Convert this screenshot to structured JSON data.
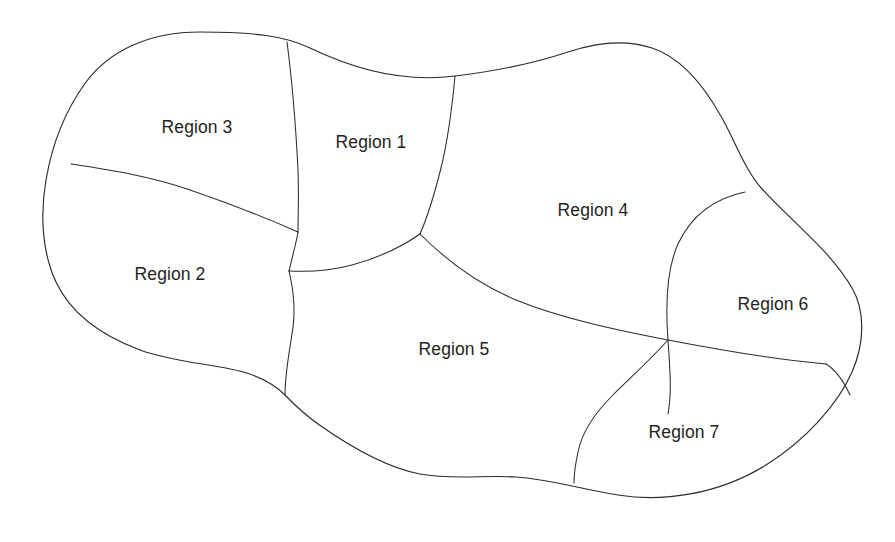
{
  "figure": {
    "kind": "region-partition-diagram",
    "background_color": "#ffffff",
    "line_color": "#2b2b2b",
    "label_color": "#231f20",
    "width": 895,
    "height": 542
  },
  "regions": [
    {
      "id": "region-1",
      "label": "Region 1",
      "label_x": 371,
      "label_y": 143
    },
    {
      "id": "region-2",
      "label": "Region 2",
      "label_x": 170,
      "label_y": 275
    },
    {
      "id": "region-3",
      "label": "Region 3",
      "label_x": 197,
      "label_y": 128
    },
    {
      "id": "region-4",
      "label": "Region 4",
      "label_x": 593,
      "label_y": 211
    },
    {
      "id": "region-5",
      "label": "Region 5",
      "label_x": 454,
      "label_y": 350
    },
    {
      "id": "region-6",
      "label": "Region 6",
      "label_x": 773,
      "label_y": 305
    },
    {
      "id": "region-7",
      "label": "Region 7",
      "label_x": 684,
      "label_y": 433
    }
  ],
  "boundaries": [
    {
      "id": "outline",
      "name": "outer-outline"
    },
    {
      "id": "b-1-3",
      "name": "boundary-region1-region3"
    },
    {
      "id": "b-2-3",
      "name": "boundary-region2-region3"
    },
    {
      "id": "b-1-4",
      "name": "boundary-region1-region4"
    },
    {
      "id": "b-1-5",
      "name": "boundary-region1-region5"
    },
    {
      "id": "b-4-5",
      "name": "boundary-region4-region5"
    },
    {
      "id": "b-2-5",
      "name": "boundary-region2-region5"
    },
    {
      "id": "b-4-6",
      "name": "boundary-region4-region6"
    },
    {
      "id": "b-5-7",
      "name": "boundary-region5-region7"
    },
    {
      "id": "b-6-7",
      "name": "boundary-region6-region7"
    }
  ]
}
